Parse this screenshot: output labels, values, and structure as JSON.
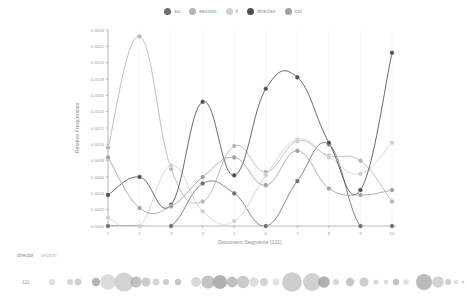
{
  "legend": {
    "items": [
      {
        "label": "su",
        "color": "#6e6e6e"
      },
      {
        "label": "section",
        "color": "#b4b4b4"
      },
      {
        "label": "li",
        "color": "#cfcfcf"
      },
      {
        "label": "director",
        "color": "#4f4f4f"
      },
      {
        "label": "cui",
        "color": "#a0a0a0"
      }
    ]
  },
  "chart_data": {
    "type": "line",
    "title": "",
    "xlabel": "Document Segments (111)",
    "ylabel": "Relative Frequencies",
    "x": [
      1,
      2,
      3,
      4,
      5,
      6,
      7,
      8,
      9,
      10
    ],
    "xlim": [
      1,
      10
    ],
    "ylim": [
      0.0,
      0.0024
    ],
    "yticks": [
      "0.0000",
      "0.0002",
      "0.0004",
      "0.0006",
      "0.0008",
      "0.0010",
      "0.0012",
      "0.0014",
      "0.0016",
      "0.0018",
      "0.0020",
      "0.0022",
      "0.0024"
    ],
    "xticks": [
      "1",
      "2",
      "3",
      "4",
      "5",
      "6",
      "7",
      "8",
      "9",
      "10"
    ],
    "grid": true,
    "legend_position": "top",
    "interpolation": "spline",
    "series": [
      {
        "name": "su",
        "color": "#6e6e6e",
        "values": [
          0.0,
          0.0,
          0.0,
          0.00052,
          0.0004,
          0.0,
          0.00055,
          0.001,
          0.0,
          0.0
        ]
      },
      {
        "name": "section",
        "color": "#b4b4b4",
        "values": [
          0.00096,
          0.00232,
          0.0007,
          0.0003,
          0.00098,
          0.00066,
          0.00104,
          0.00086,
          0.0008,
          0.0003
        ]
      },
      {
        "name": "li",
        "color": "#cfcfcf",
        "values": [
          0.0001,
          0.0,
          0.00074,
          0.00018,
          6e-05,
          0.00062,
          0.00106,
          0.00084,
          0.00064,
          0.00102
        ]
      },
      {
        "name": "director",
        "color": "#4f4f4f",
        "values": [
          0.00038,
          0.0006,
          0.00026,
          0.00152,
          0.00062,
          0.00168,
          0.00182,
          0.00102,
          0.00044,
          0.00212
        ]
      },
      {
        "name": "cui",
        "color": "#a0a0a0",
        "values": [
          0.00084,
          0.00022,
          0.00024,
          0.0006,
          0.00084,
          0.0005,
          0.00092,
          0.00046,
          0.00038,
          0.00044
        ]
      }
    ]
  },
  "dispersion": {
    "legend": [
      {
        "label": "director",
        "color": "#8c8c8c"
      },
      {
        "label": "section",
        "color": "#c2c2c2"
      }
    ],
    "row_label": "111",
    "bubbles": [
      {
        "x": 52,
        "r": 3.2,
        "color": "#d6d6d6"
      },
      {
        "x": 70,
        "r": 3.0,
        "color": "#c9c9c9"
      },
      {
        "x": 78,
        "r": 3.4,
        "color": "#c4c4c4"
      },
      {
        "x": 96,
        "r": 4.2,
        "color": "#9f9f9f"
      },
      {
        "x": 108,
        "r": 7.8,
        "color": "#d2d2d2"
      },
      {
        "x": 124,
        "r": 9.6,
        "color": "#c6c6c6"
      },
      {
        "x": 136,
        "r": 5.6,
        "color": "#b0b0b0"
      },
      {
        "x": 146,
        "r": 4.6,
        "color": "#bcbcbc"
      },
      {
        "x": 156,
        "r": 3.4,
        "color": "#cccccc"
      },
      {
        "x": 166,
        "r": 3.0,
        "color": "#c0c0c0"
      },
      {
        "x": 178,
        "r": 3.2,
        "color": "#b8b8b8"
      },
      {
        "x": 196,
        "r": 5.0,
        "color": "#d0d0d0"
      },
      {
        "x": 208,
        "r": 6.6,
        "color": "#b4b4b4"
      },
      {
        "x": 220,
        "r": 7.0,
        "color": "#9a9a9a"
      },
      {
        "x": 232,
        "r": 5.4,
        "color": "#adadad"
      },
      {
        "x": 243,
        "r": 6.2,
        "color": "#bdbdbd"
      },
      {
        "x": 254,
        "r": 4.6,
        "color": "#d4d4d4"
      },
      {
        "x": 264,
        "r": 4.0,
        "color": "#c8c8c8"
      },
      {
        "x": 276,
        "r": 3.4,
        "color": "#d8d8d8"
      },
      {
        "x": 292,
        "r": 9.8,
        "color": "#c0c0c0"
      },
      {
        "x": 312,
        "r": 9.0,
        "color": "#c4c4c4"
      },
      {
        "x": 324,
        "r": 5.8,
        "color": "#9c9c9c"
      },
      {
        "x": 336,
        "r": 3.0,
        "color": "#cacaca"
      },
      {
        "x": 350,
        "r": 4.2,
        "color": "#b6b6b6"
      },
      {
        "x": 364,
        "r": 4.6,
        "color": "#c2c2c2"
      },
      {
        "x": 376,
        "r": 2.6,
        "color": "#d0d0d0"
      },
      {
        "x": 386,
        "r": 2.2,
        "color": "#cfcfcf"
      },
      {
        "x": 396,
        "r": 3.2,
        "color": "#b2b2b2"
      },
      {
        "x": 406,
        "r": 2.8,
        "color": "#d6d6d6"
      },
      {
        "x": 424,
        "r": 8.0,
        "color": "#a8a8a8"
      },
      {
        "x": 438,
        "r": 5.8,
        "color": "#c6c6c6"
      },
      {
        "x": 448,
        "r": 3.0,
        "color": "#bfbfbf"
      },
      {
        "x": 456,
        "r": 2.2,
        "color": "#d2d2d2"
      },
      {
        "x": 463,
        "r": 1.4,
        "color": "#c8c8c8"
      }
    ]
  }
}
